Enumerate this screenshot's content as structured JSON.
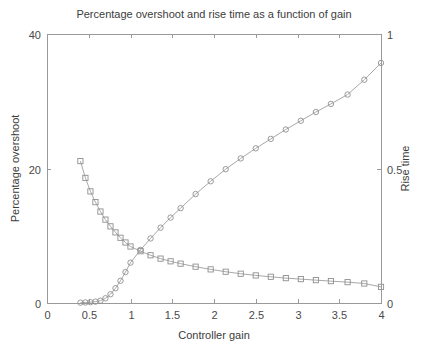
{
  "chart_data": {
    "type": "line",
    "title": "Percentage overshoot and rise time as a function of gain",
    "xlabel": "Controller gain",
    "ylabel": "Percentage overshoot",
    "y2label": "Rise time",
    "xlim": [
      0,
      4
    ],
    "ylim": [
      0,
      40
    ],
    "y2lim": [
      0,
      1
    ],
    "xticks": [
      0,
      0.5,
      1,
      1.5,
      2,
      2.5,
      3,
      3.5,
      4
    ],
    "xticklabels": [
      "0",
      "0.5",
      "1",
      "1.5",
      "2",
      "2.5",
      "3",
      "3.5",
      "4"
    ],
    "yticks": [
      0,
      20,
      40
    ],
    "yticklabels": [
      "0",
      "20",
      "40"
    ],
    "y2ticks": [
      0,
      0.5,
      1
    ],
    "y2ticklabels": [
      "0",
      "0.5",
      "1"
    ],
    "grid": false,
    "legend": "none",
    "series": [
      {
        "name": "Percentage overshoot",
        "marker": "circle",
        "axis": "left",
        "color": "#9e9e9e",
        "x": [
          0.4,
          0.46,
          0.52,
          0.58,
          0.64,
          0.7,
          0.76,
          0.82,
          0.88,
          0.94,
          1.0,
          1.12,
          1.24,
          1.36,
          1.48,
          1.6,
          1.78,
          1.96,
          2.14,
          2.32,
          2.5,
          2.68,
          2.86,
          3.04,
          3.22,
          3.4,
          3.6,
          3.8,
          4.0
        ],
        "y": [
          0.05,
          0.08,
          0.12,
          0.2,
          0.35,
          0.7,
          1.3,
          2.2,
          3.3,
          4.6,
          6.0,
          7.9,
          9.6,
          11.2,
          12.7,
          14.1,
          16.2,
          18.1,
          19.9,
          21.5,
          23.0,
          24.4,
          25.8,
          27.1,
          28.4,
          29.6,
          31.0,
          33.2,
          35.7
        ]
      },
      {
        "name": "Rise time",
        "marker": "square",
        "axis": "right",
        "color": "#9e9e9e",
        "x": [
          0.4,
          0.46,
          0.52,
          0.58,
          0.64,
          0.7,
          0.76,
          0.82,
          0.88,
          0.94,
          1.0,
          1.12,
          1.24,
          1.36,
          1.48,
          1.6,
          1.78,
          1.96,
          2.14,
          2.32,
          2.5,
          2.68,
          2.86,
          3.04,
          3.22,
          3.4,
          3.6,
          3.8,
          4.0
        ],
        "y": [
          0.5275,
          0.465,
          0.415,
          0.375,
          0.34,
          0.31,
          0.285,
          0.2625,
          0.2425,
          0.225,
          0.21,
          0.1925,
          0.1775,
          0.165,
          0.155,
          0.1463,
          0.135,
          0.125,
          0.1163,
          0.1088,
          0.1025,
          0.0975,
          0.0925,
          0.0888,
          0.085,
          0.0813,
          0.0775,
          0.0725,
          0.06
        ]
      }
    ]
  },
  "figure": {
    "plot_left": 47,
    "plot_right": 381,
    "plot_top": 34,
    "plot_bottom": 303
  }
}
